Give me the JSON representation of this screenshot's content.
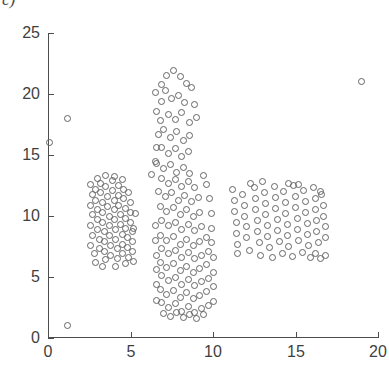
{
  "panel": {
    "label": "c)"
  },
  "chart_data": {
    "type": "scatter",
    "title": "",
    "xlabel": "",
    "ylabel": "",
    "xlim": [
      0,
      20
    ],
    "ylim": [
      0,
      25
    ],
    "xticks": [
      0,
      5,
      10,
      15,
      20
    ],
    "yticks": [
      0,
      5,
      10,
      15,
      20,
      25
    ],
    "xticklabels": [
      "0",
      "5",
      "10",
      "15",
      "20"
    ],
    "yticklabels": [
      "0",
      "5",
      "10",
      "15",
      "20",
      "25"
    ],
    "grid": false,
    "legend": null,
    "marker": {
      "shape": "circle-open",
      "size_px": 7,
      "edge_color": "#646464",
      "face_color": "none"
    },
    "axis_color": "#4d4d4d",
    "background": "#ffffff",
    "series": [
      {
        "name": "points",
        "points": [
          [
            0.1,
            16.0
          ],
          [
            1.2,
            18.0
          ],
          [
            1.2,
            1.0
          ],
          [
            19.0,
            21.0
          ],
          [
            2.6,
            12.6
          ],
          [
            2.7,
            11.8
          ],
          [
            2.6,
            10.9
          ],
          [
            2.7,
            10.1
          ],
          [
            2.6,
            9.2
          ],
          [
            2.7,
            8.4
          ],
          [
            2.6,
            7.6
          ],
          [
            2.8,
            6.9
          ],
          [
            2.9,
            12.2
          ],
          [
            2.9,
            11.3
          ],
          [
            3.0,
            10.5
          ],
          [
            3.0,
            9.7
          ],
          [
            3.0,
            8.9
          ],
          [
            3.1,
            8.1
          ],
          [
            3.1,
            7.3
          ],
          [
            3.2,
            12.7
          ],
          [
            3.2,
            11.9
          ],
          [
            3.3,
            11.1
          ],
          [
            3.3,
            10.3
          ],
          [
            3.3,
            9.5
          ],
          [
            3.4,
            8.7
          ],
          [
            3.4,
            7.9
          ],
          [
            3.4,
            7.1
          ],
          [
            3.5,
            6.4
          ],
          [
            3.5,
            12.4
          ],
          [
            3.6,
            11.6
          ],
          [
            3.6,
            10.8
          ],
          [
            3.7,
            10.0
          ],
          [
            3.7,
            9.2
          ],
          [
            3.7,
            8.4
          ],
          [
            3.8,
            7.6
          ],
          [
            3.8,
            6.8
          ],
          [
            3.9,
            12.9
          ],
          [
            3.9,
            12.1
          ],
          [
            4.0,
            11.3
          ],
          [
            4.0,
            10.5
          ],
          [
            4.0,
            9.7
          ],
          [
            4.1,
            8.9
          ],
          [
            4.1,
            8.1
          ],
          [
            4.2,
            7.3
          ],
          [
            4.2,
            6.5
          ],
          [
            4.3,
            12.5
          ],
          [
            4.3,
            11.7
          ],
          [
            4.3,
            10.9
          ],
          [
            4.4,
            10.1
          ],
          [
            4.4,
            9.3
          ],
          [
            4.5,
            8.5
          ],
          [
            4.5,
            7.7
          ],
          [
            4.5,
            6.9
          ],
          [
            4.6,
            12.2
          ],
          [
            4.6,
            11.4
          ],
          [
            4.7,
            10.6
          ],
          [
            4.7,
            9.8
          ],
          [
            4.7,
            9.0
          ],
          [
            4.8,
            8.2
          ],
          [
            4.8,
            7.4
          ],
          [
            4.9,
            6.6
          ],
          [
            4.9,
            11.9
          ],
          [
            5.0,
            11.1
          ],
          [
            5.0,
            10.3
          ],
          [
            5.0,
            9.5
          ],
          [
            5.1,
            8.7
          ],
          [
            5.1,
            7.9
          ],
          [
            5.1,
            7.1
          ],
          [
            5.2,
            6.3
          ],
          [
            3.0,
            13.1
          ],
          [
            3.5,
            13.3
          ],
          [
            4.0,
            13.2
          ],
          [
            4.5,
            13.0
          ],
          [
            2.9,
            6.2
          ],
          [
            3.3,
            5.9
          ],
          [
            4.1,
            5.9
          ],
          [
            4.7,
            6.1
          ],
          [
            5.2,
            9.0
          ],
          [
            5.3,
            10.2
          ],
          [
            6.3,
            13.4
          ],
          [
            6.5,
            14.5
          ],
          [
            6.6,
            15.6
          ],
          [
            6.7,
            16.7
          ],
          [
            6.8,
            17.8
          ],
          [
            6.6,
            18.6
          ],
          [
            6.9,
            19.4
          ],
          [
            6.5,
            20.1
          ],
          [
            6.9,
            20.8
          ],
          [
            7.2,
            21.5
          ],
          [
            7.6,
            21.9
          ],
          [
            8.0,
            21.4
          ],
          [
            8.4,
            20.9
          ],
          [
            7.1,
            20.3
          ],
          [
            7.5,
            19.6
          ],
          [
            7.9,
            19.9
          ],
          [
            8.3,
            19.3
          ],
          [
            8.7,
            20.5
          ],
          [
            8.9,
            19.1
          ],
          [
            7.3,
            18.3
          ],
          [
            7.7,
            17.9
          ],
          [
            8.1,
            18.5
          ],
          [
            8.6,
            17.7
          ],
          [
            9.0,
            18.1
          ],
          [
            7.0,
            17.1
          ],
          [
            7.4,
            16.4
          ],
          [
            7.8,
            16.9
          ],
          [
            8.2,
            16.2
          ],
          [
            8.6,
            16.6
          ],
          [
            6.9,
            15.6
          ],
          [
            7.3,
            15.1
          ],
          [
            7.7,
            15.5
          ],
          [
            8.1,
            14.9
          ],
          [
            8.5,
            15.3
          ],
          [
            6.6,
            14.3
          ],
          [
            7.0,
            13.9
          ],
          [
            7.4,
            14.2
          ],
          [
            7.8,
            13.6
          ],
          [
            8.2,
            14.0
          ],
          [
            8.6,
            13.5
          ],
          [
            6.9,
            13.1
          ],
          [
            7.3,
            12.7
          ],
          [
            7.7,
            13.0
          ],
          [
            8.1,
            12.4
          ],
          [
            8.5,
            12.8
          ],
          [
            8.9,
            12.3
          ],
          [
            6.7,
            12.0
          ],
          [
            7.1,
            11.6
          ],
          [
            7.5,
            11.9
          ],
          [
            7.9,
            11.3
          ],
          [
            8.3,
            11.7
          ],
          [
            8.7,
            11.2
          ],
          [
            9.1,
            11.5
          ],
          [
            6.8,
            10.8
          ],
          [
            7.2,
            10.4
          ],
          [
            7.6,
            10.7
          ],
          [
            8.0,
            10.1
          ],
          [
            8.4,
            10.5
          ],
          [
            8.8,
            10.0
          ],
          [
            9.2,
            10.3
          ],
          [
            6.9,
            9.6
          ],
          [
            7.3,
            9.2
          ],
          [
            7.7,
            9.5
          ],
          [
            8.1,
            8.9
          ],
          [
            8.5,
            9.3
          ],
          [
            8.9,
            8.8
          ],
          [
            9.3,
            9.1
          ],
          [
            6.8,
            8.4
          ],
          [
            7.2,
            8.0
          ],
          [
            7.6,
            8.3
          ],
          [
            8.0,
            7.7
          ],
          [
            8.4,
            8.1
          ],
          [
            8.8,
            7.6
          ],
          [
            9.2,
            7.9
          ],
          [
            9.6,
            8.2
          ],
          [
            6.9,
            7.3
          ],
          [
            7.3,
            6.9
          ],
          [
            7.7,
            7.2
          ],
          [
            8.1,
            6.6
          ],
          [
            8.5,
            7.0
          ],
          [
            8.9,
            6.5
          ],
          [
            9.3,
            6.8
          ],
          [
            9.7,
            7.1
          ],
          [
            6.8,
            6.2
          ],
          [
            7.2,
            5.8
          ],
          [
            7.6,
            6.1
          ],
          [
            8.0,
            5.5
          ],
          [
            8.4,
            5.9
          ],
          [
            8.8,
            5.4
          ],
          [
            9.2,
            5.7
          ],
          [
            9.6,
            6.0
          ],
          [
            6.9,
            5.1
          ],
          [
            7.3,
            4.7
          ],
          [
            7.7,
            5.0
          ],
          [
            8.1,
            4.4
          ],
          [
            8.5,
            4.8
          ],
          [
            8.9,
            4.3
          ],
          [
            9.3,
            4.6
          ],
          [
            9.7,
            4.9
          ],
          [
            6.8,
            4.0
          ],
          [
            7.2,
            3.6
          ],
          [
            7.6,
            3.9
          ],
          [
            8.0,
            3.3
          ],
          [
            8.4,
            3.7
          ],
          [
            8.8,
            3.2
          ],
          [
            9.2,
            3.5
          ],
          [
            9.6,
            3.8
          ],
          [
            6.9,
            2.9
          ],
          [
            7.3,
            2.5
          ],
          [
            7.7,
            2.8
          ],
          [
            8.1,
            2.2
          ],
          [
            8.5,
            2.6
          ],
          [
            8.9,
            2.1
          ],
          [
            9.3,
            2.4
          ],
          [
            9.7,
            2.7
          ],
          [
            7.0,
            2.0
          ],
          [
            7.4,
            1.8
          ],
          [
            7.8,
            2.1
          ],
          [
            8.2,
            1.7
          ],
          [
            8.6,
            1.9
          ],
          [
            9.0,
            1.6
          ],
          [
            9.4,
            1.9
          ],
          [
            6.6,
            3.1
          ],
          [
            6.6,
            4.4
          ],
          [
            6.6,
            5.6
          ],
          [
            6.6,
            6.8
          ],
          [
            6.5,
            8.0
          ],
          [
            6.5,
            9.2
          ],
          [
            10.0,
            3.0
          ],
          [
            10.0,
            4.2
          ],
          [
            10.0,
            5.4
          ],
          [
            10.0,
            6.6
          ],
          [
            9.9,
            7.8
          ],
          [
            9.9,
            9.0
          ],
          [
            9.9,
            10.2
          ],
          [
            9.8,
            11.4
          ],
          [
            9.6,
            12.6
          ],
          [
            9.4,
            13.3
          ],
          [
            11.2,
            12.2
          ],
          [
            11.3,
            11.3
          ],
          [
            11.3,
            10.4
          ],
          [
            11.4,
            9.5
          ],
          [
            11.4,
            8.6
          ],
          [
            11.5,
            7.7
          ],
          [
            11.5,
            6.9
          ],
          [
            11.8,
            11.8
          ],
          [
            11.9,
            10.9
          ],
          [
            11.9,
            10.0
          ],
          [
            12.0,
            9.1
          ],
          [
            12.0,
            8.2
          ],
          [
            12.5,
            12.3
          ],
          [
            12.6,
            11.4
          ],
          [
            12.6,
            10.5
          ],
          [
            12.7,
            9.6
          ],
          [
            12.7,
            8.7
          ],
          [
            12.8,
            7.8
          ],
          [
            13.1,
            11.9
          ],
          [
            13.2,
            11.0
          ],
          [
            13.2,
            10.1
          ],
          [
            13.3,
            9.2
          ],
          [
            13.3,
            8.3
          ],
          [
            13.4,
            7.4
          ],
          [
            13.7,
            12.4
          ],
          [
            13.8,
            11.5
          ],
          [
            13.8,
            10.6
          ],
          [
            13.9,
            9.7
          ],
          [
            13.9,
            8.8
          ],
          [
            14.0,
            7.9
          ],
          [
            14.3,
            12.0
          ],
          [
            14.4,
            11.1
          ],
          [
            14.4,
            10.2
          ],
          [
            14.5,
            9.3
          ],
          [
            14.5,
            8.4
          ],
          [
            14.6,
            7.5
          ],
          [
            14.9,
            12.5
          ],
          [
            15.0,
            11.6
          ],
          [
            15.0,
            10.7
          ],
          [
            15.1,
            9.8
          ],
          [
            15.1,
            8.9
          ],
          [
            15.2,
            8.0
          ],
          [
            15.5,
            12.1
          ],
          [
            15.6,
            11.2
          ],
          [
            15.6,
            10.3
          ],
          [
            15.7,
            9.4
          ],
          [
            15.7,
            8.5
          ],
          [
            15.8,
            7.6
          ],
          [
            16.1,
            12.3
          ],
          [
            16.2,
            11.4
          ],
          [
            16.2,
            10.5
          ],
          [
            16.3,
            9.6
          ],
          [
            16.3,
            8.7
          ],
          [
            16.4,
            7.8
          ],
          [
            16.6,
            11.8
          ],
          [
            16.7,
            10.9
          ],
          [
            16.7,
            10.0
          ],
          [
            16.8,
            9.1
          ],
          [
            16.8,
            8.2
          ],
          [
            16.2,
            6.9
          ],
          [
            16.5,
            6.5
          ],
          [
            16.8,
            6.8
          ],
          [
            12.2,
            7.2
          ],
          [
            12.9,
            6.8
          ],
          [
            13.6,
            6.6
          ],
          [
            14.2,
            6.9
          ],
          [
            14.8,
            6.7
          ],
          [
            15.4,
            7.0
          ],
          [
            15.9,
            6.6
          ],
          [
            12.3,
            12.7
          ],
          [
            13.0,
            12.8
          ],
          [
            14.6,
            12.7
          ],
          [
            15.2,
            12.6
          ],
          [
            16.5,
            12.0
          ]
        ]
      }
    ]
  }
}
